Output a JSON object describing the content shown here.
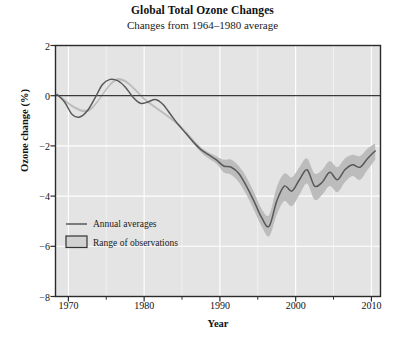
{
  "chart_data": {
    "type": "line",
    "title": "Global Total Ozone Changes",
    "subtitle": "Changes from 1964–1980 average",
    "xlabel": "Year",
    "ylabel": "Ozone change (%)",
    "xlim": [
      1968.3,
      2011.2
    ],
    "ylim": [
      -8,
      2
    ],
    "xticks": [
      1970,
      1980,
      1990,
      2000,
      2010
    ],
    "xticklabels": [
      "1970",
      "1980",
      "1990",
      "2000",
      "2010"
    ],
    "xminorticks": [
      1975,
      1985,
      1995,
      2005
    ],
    "yticks": [
      2,
      0,
      -2,
      -4,
      -6,
      -8
    ],
    "yticklabels": [
      "2",
      "0",
      "−2",
      "−4",
      "−6",
      "−8"
    ],
    "grid": true,
    "grid_color": "#ffffff",
    "plot_bg": "#e4e4e4",
    "zero_line": 0,
    "legend_position": "lower left",
    "series": [
      {
        "name": "Annual averages",
        "style": "line",
        "color": "#585858",
        "x": [
          1968.5,
          1969.5,
          1970.5,
          1971.5,
          1972.5,
          1973.5,
          1974.5,
          1975.5,
          1976.5,
          1977.5,
          1978.5,
          1979.5,
          1980.5,
          1981.5,
          1982.5,
          1983.5,
          1984.5,
          1985.5,
          1986.5,
          1987.5,
          1988.5,
          1989.5,
          1990.5,
          1991.5,
          1992.5,
          1993.5,
          1994.5,
          1995.5,
          1996.5,
          1997.5,
          1998.5,
          1999.5,
          2000.5,
          2001.5,
          2002.5,
          2003.5,
          2004.5,
          2005.5,
          2006.5,
          2007.5,
          2008.5,
          2009.5,
          2010.5
        ],
        "values": [
          0.05,
          -0.25,
          -0.75,
          -0.85,
          -0.6,
          -0.1,
          0.45,
          0.65,
          0.6,
          0.35,
          -0.05,
          -0.3,
          -0.25,
          -0.15,
          -0.35,
          -0.75,
          -1.15,
          -1.5,
          -1.85,
          -2.15,
          -2.35,
          -2.55,
          -2.8,
          -2.85,
          -3.1,
          -3.6,
          -4.2,
          -4.85,
          -5.2,
          -4.2,
          -3.6,
          -3.8,
          -3.35,
          -2.95,
          -3.6,
          -3.45,
          -3.05,
          -3.35,
          -2.95,
          -2.75,
          -2.85,
          -2.5,
          -2.2
        ]
      },
      {
        "name": "Range of observations",
        "style": "band",
        "color": "#b9b9b9",
        "x": [
          1968.5,
          1972.5,
          1976.5,
          1980.5,
          1984.5,
          1987.5,
          1989.5,
          1990.5,
          1991.5,
          1992.5,
          1993.5,
          1994.5,
          1995.5,
          1996.5,
          1997.5,
          1998.5,
          1999.5,
          2000.5,
          2001.5,
          2002.5,
          2003.5,
          2004.5,
          2005.5,
          2006.5,
          2007.5,
          2008.5,
          2009.5,
          2010.5
        ],
        "upper": [
          0.1,
          -0.55,
          0.7,
          -0.2,
          -1.1,
          -2.05,
          -2.4,
          -2.55,
          -2.55,
          -2.8,
          -3.25,
          -3.85,
          -4.5,
          -4.75,
          -3.65,
          -3.1,
          -3.25,
          -2.85,
          -2.5,
          -3.1,
          -2.95,
          -2.6,
          -2.85,
          -2.5,
          -2.35,
          -2.4,
          -2.1,
          -1.9
        ],
        "lower": [
          0.0,
          -0.65,
          0.6,
          -0.3,
          -1.2,
          -2.25,
          -2.7,
          -3.05,
          -3.15,
          -3.45,
          -3.95,
          -4.55,
          -5.2,
          -5.6,
          -4.75,
          -4.2,
          -4.4,
          -3.95,
          -3.5,
          -4.15,
          -3.95,
          -3.6,
          -3.85,
          -3.45,
          -3.2,
          -3.35,
          -2.95,
          -2.55
        ]
      }
    ],
    "legend_items": [
      {
        "label": "Annual averages",
        "marker": "line",
        "color": "#585858"
      },
      {
        "label": "Range of observations",
        "marker": "box",
        "color": "#d2d2d2",
        "border": "#333333"
      }
    ]
  }
}
